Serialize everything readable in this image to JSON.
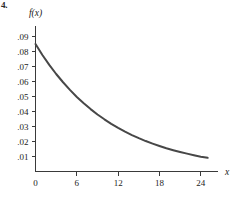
{
  "figure": {
    "label": "4."
  },
  "chart_data": {
    "type": "line",
    "title": "",
    "subtitle": "",
    "xlabel": "x",
    "ylabel": "f(x)",
    "xlim": [
      0,
      26.5
    ],
    "ylim": [
      0,
      0.097
    ],
    "grid": false,
    "legend": null,
    "x_ticks": [
      0,
      6,
      12,
      18,
      24
    ],
    "x_tick_labels": [
      "0",
      "6",
      "12",
      "18",
      "24"
    ],
    "y_ticks": [
      0.01,
      0.02,
      0.03,
      0.04,
      0.05,
      0.06,
      0.07,
      0.08,
      0.09
    ],
    "y_tick_labels": [
      ".01",
      ".02",
      ".03",
      ".04",
      ".05",
      ".06",
      ".07",
      ".08",
      ".09"
    ],
    "series": [
      {
        "name": "f(x)",
        "color": "#474747",
        "x": [
          0,
          1,
          2,
          3,
          4,
          5,
          6,
          7,
          8,
          9,
          10,
          11,
          12,
          13,
          14,
          15,
          16,
          17,
          18,
          19,
          20,
          21,
          22,
          23,
          24,
          25
        ],
        "values": [
          0.085,
          0.0777,
          0.0711,
          0.065,
          0.0595,
          0.0544,
          0.0497,
          0.0455,
          0.0416,
          0.038,
          0.0348,
          0.0318,
          0.0291,
          0.0266,
          0.0243,
          0.0222,
          0.0203,
          0.0186,
          0.017,
          0.0155,
          0.0142,
          0.013,
          0.0119,
          0.0109,
          0.0099,
          0.0091
        ]
      }
    ]
  }
}
